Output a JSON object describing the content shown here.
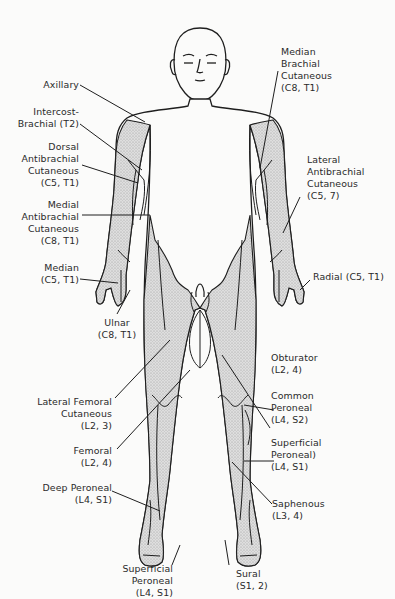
{
  "diagram": {
    "colors": {
      "line": "#1e1e1e",
      "shade": "#cfcfcf",
      "background": "#fbfbfa"
    },
    "labels": {
      "axillary": {
        "lines": [
          "Axillary"
        ]
      },
      "intercostobrachial": {
        "lines": [
          "Intercost-",
          "Brachial (T2)"
        ]
      },
      "dorsal_antibrachial": {
        "lines": [
          "Dorsal",
          "Antibrachial",
          "Cutaneous",
          "(C5, T1)"
        ]
      },
      "medial_antibrachial": {
        "lines": [
          "Medial",
          "Antibrachial",
          "Cutaneous",
          "(C8, T1)"
        ]
      },
      "median": {
        "lines": [
          "Median",
          "(C5, T1)"
        ]
      },
      "ulnar": {
        "lines": [
          "Ulnar",
          "(C8, T1)"
        ]
      },
      "lateral_femoral": {
        "lines": [
          "Lateral Femoral",
          "Cutaneous",
          "(L2, 3)"
        ]
      },
      "femoral": {
        "lines": [
          "Femoral",
          "(L2, 4)"
        ]
      },
      "deep_peroneal": {
        "lines": [
          "Deep Peroneal",
          "(L4, S1)"
        ]
      },
      "superficial_peroneal_foot": {
        "lines": [
          "Superficial",
          "Peroneal",
          "(L4, S1)"
        ]
      },
      "median_brachial": {
        "lines": [
          "Median",
          "Brachial",
          "Cutaneous",
          "(C8, T1)"
        ]
      },
      "lateral_antibrachial": {
        "lines": [
          "Lateral",
          "Antibrachial",
          "Cutaneous",
          "(C5, 7)"
        ]
      },
      "radial": {
        "lines": [
          "Radial (C5, T1)"
        ]
      },
      "obturator": {
        "lines": [
          "Obturator",
          "(L2, 4)"
        ]
      },
      "common_peroneal": {
        "lines": [
          "Common",
          "Peroneal",
          "(L4, S2)"
        ]
      },
      "superficial_peroneal_leg": {
        "lines": [
          "Superficial",
          "Peroneal)",
          "(L4, S1)"
        ]
      },
      "saphenous": {
        "lines": [
          "Saphenous",
          "(L3, 4)"
        ]
      },
      "sural": {
        "lines": [
          "Sural",
          "(S1, 2)"
        ]
      }
    }
  }
}
